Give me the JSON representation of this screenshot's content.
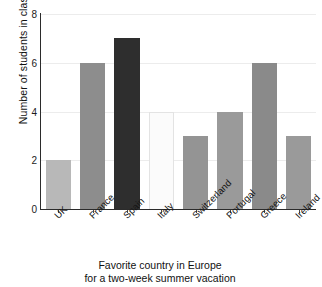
{
  "chart_data": {
    "type": "bar",
    "title": "",
    "caption_line_1": "Favorite country in Europe",
    "caption_line_2": "for a two-week summer vacation",
    "xlabel": "",
    "ylabel": "Number of students in class",
    "categories": [
      "UK",
      "France",
      "Spain",
      "Italy",
      "Switzerland",
      "Portugal",
      "Greece",
      "Ireland"
    ],
    "values": [
      2,
      6,
      7,
      4,
      3,
      4,
      6,
      3
    ],
    "bar_colors": [
      "#b8b8b8",
      "#8d8d8d",
      "#2e2e2e",
      "#fbfbfb",
      "#949494",
      "#9a9a9a",
      "#8a8a8a",
      "#9a9a9a"
    ],
    "ylim": [
      0,
      8
    ],
    "ytick_labels": [
      "0",
      "2",
      "4",
      "6",
      "8"
    ],
    "ytick_values": [
      0,
      2,
      4,
      6,
      8
    ],
    "grid": "horizontal",
    "gridline_color": "#ececec",
    "axis_color": "#2b2b2b",
    "legend": "none",
    "xtick_label_rotation": -45,
    "background_color": "#ffffff"
  }
}
